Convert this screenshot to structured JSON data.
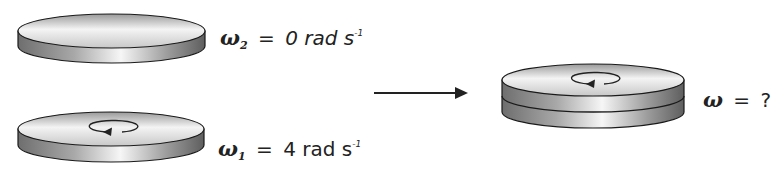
{
  "diagram": {
    "type": "physics-rotation-collision",
    "disks": [
      {
        "id": "disk-2",
        "rotating": false
      },
      {
        "id": "disk-1",
        "rotating": true,
        "rotation_direction": "counterclockwise"
      },
      {
        "id": "combined-disk",
        "rotating": true,
        "rotation_direction": "counterclockwise"
      }
    ],
    "labels": {
      "omega2": {
        "symbol": "ω",
        "subscript": "2",
        "equals": "=",
        "value": "0 rad s",
        "superscript": "-1"
      },
      "omega1": {
        "symbol": "ω",
        "subscript": "1",
        "equals": "=",
        "value": "4 rad s",
        "superscript": "-1"
      },
      "omega_final": {
        "symbol": "ω",
        "equals": "=",
        "value": "?"
      }
    },
    "colors": {
      "edge": "#1a1a1a",
      "face_light": "#f2f2f2",
      "face_dark": "#8c8c8c"
    }
  }
}
